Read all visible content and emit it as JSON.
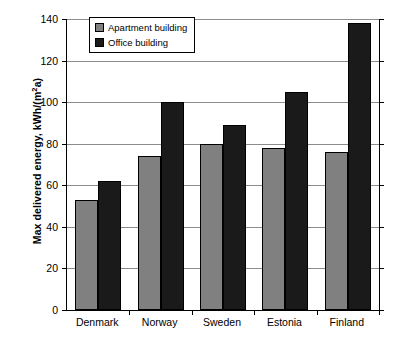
{
  "chart_data": {
    "type": "bar",
    "title": "",
    "xlabel": "",
    "ylabel": "Max delivered energy, kWh/(m²a)",
    "ylabel_parts": {
      "main": "Max delivered energy, kWh/(m",
      "sup": "2",
      "tail": "a)"
    },
    "categories": [
      "Denmark",
      "Norway",
      "Sweden",
      "Estonia",
      "Finland"
    ],
    "series": [
      {
        "name": "Apartment building",
        "color": "#808080",
        "values": [
          53,
          74,
          80,
          78,
          76
        ]
      },
      {
        "name": "Office building",
        "color": "#1a1a1a",
        "values": [
          62,
          100,
          89,
          105,
          138
        ]
      }
    ],
    "ylim": [
      0,
      140
    ],
    "ytick_step": 20,
    "yticks": [
      0,
      20,
      40,
      60,
      80,
      100,
      120,
      140
    ],
    "grid": true,
    "legend_position": "top-left-inside"
  },
  "legend": {
    "items": [
      {
        "label": "Apartment building"
      },
      {
        "label": "Office building"
      }
    ]
  },
  "colors": {
    "apartment": "#808080",
    "office": "#1a1a1a",
    "gridline": "#8c8c8c",
    "axis": "#000000",
    "background": "#ffffff"
  }
}
